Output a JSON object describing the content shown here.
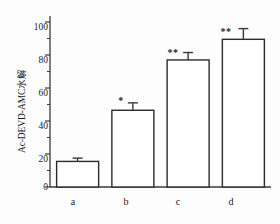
{
  "chart_data": {
    "type": "bar",
    "title": "",
    "xlabel": "",
    "ylabel": "Ac-DEVD-AMC水解",
    "categories": [
      "a",
      "b",
      "c",
      "d"
    ],
    "values": [
      15.5,
      46.5,
      77.0,
      89.5
    ],
    "errors": [
      2.0,
      4.5,
      4.5,
      6.5
    ],
    "annotations": [
      "",
      "*",
      "**",
      "**"
    ],
    "ylim": [
      0,
      100
    ],
    "y_ticks": [
      0,
      20,
      40,
      60,
      80,
      100
    ],
    "y_tick_labels": [
      "0",
      "20",
      "40",
      "60",
      "80",
      "100"
    ],
    "y_minor_ticks": [
      10,
      30,
      50,
      70,
      90
    ],
    "grid": false,
    "legend": null,
    "bar_facecolor": "#ffffff",
    "bar_edgecolor": "#2b2b2b",
    "axis_color": "#3a3a3a",
    "error_bar_color": "#3a3a3a"
  },
  "axes": {
    "y_title": "Ac-DEVD-AMC水解",
    "tick_labels_y": [
      "100",
      "80",
      "60",
      "40",
      "20",
      "0"
    ],
    "tick_labels_x": [
      "a",
      "b",
      "c",
      "d"
    ]
  },
  "markers": {
    "bar_a": "",
    "bar_b": "*",
    "bar_c": "**",
    "bar_d": "**"
  }
}
